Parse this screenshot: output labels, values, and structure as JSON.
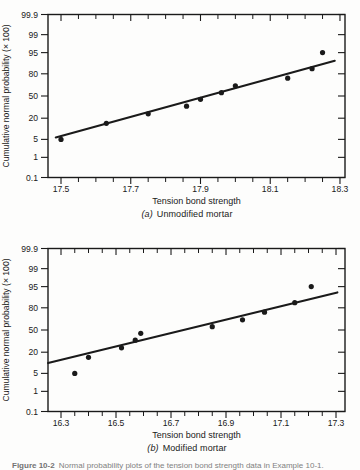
{
  "page": {
    "background": "#fdfdfc",
    "ink_color": "#1a1a1a"
  },
  "chart_data": [
    {
      "id": "a",
      "type": "scatter",
      "caption_label": "(a)",
      "caption_text": "Unmodified mortar",
      "xlabel": "Tension bond strength",
      "ylabel": "Cumulative normal probability (× 100)",
      "y_scale": "normal-probability",
      "y_tick_labels": [
        "99.9",
        "99",
        "95",
        "80",
        "50",
        "20",
        "5",
        "1",
        "0.1"
      ],
      "ylim_percent": [
        0.1,
        99.9
      ],
      "x_major_ticks": [
        17.5,
        17.7,
        17.9,
        18.1,
        18.3
      ],
      "x_minor_step": 0.05,
      "xlim": [
        17.4627,
        18.3144
      ],
      "grid": false,
      "legend": "none",
      "points_x": [
        17.5,
        17.63,
        17.75,
        17.86,
        17.9,
        17.96,
        18.0,
        18.15,
        18.22,
        18.25
      ],
      "points_percent": [
        5,
        15,
        25,
        35,
        45,
        55,
        65,
        75,
        85,
        95
      ],
      "fit_line": {
        "x1": 17.485,
        "p1": 5.8,
        "x2": 18.285,
        "p2": 90.9
      }
    },
    {
      "id": "b",
      "type": "scatter",
      "caption_label": "(b)",
      "caption_text": "Modified mortar",
      "xlabel": "Tension bond strength",
      "ylabel": "Cumulative normal probability (× 100)",
      "y_scale": "normal-probability",
      "y_tick_labels": [
        "99.9",
        "99",
        "95",
        "80",
        "50",
        "20",
        "5",
        "1",
        "0.1"
      ],
      "ylim_percent": [
        0.1,
        99.9
      ],
      "x_major_ticks": [
        16.3,
        16.5,
        16.7,
        16.9,
        17.1,
        17.3
      ],
      "x_minor_step": 0.05,
      "xlim": [
        16.2527,
        17.3327
      ],
      "grid": false,
      "legend": "none",
      "points_x": [
        16.35,
        16.4,
        16.52,
        16.57,
        16.59,
        16.85,
        16.96,
        17.04,
        17.15,
        17.21
      ],
      "points_percent": [
        5,
        15,
        25,
        35,
        45,
        55,
        65,
        75,
        85,
        95
      ],
      "fit_line": {
        "x1": 16.253,
        "p1": 10.5,
        "x2": 17.305,
        "p2": 92.3
      }
    }
  ],
  "cropped_caption": {
    "bold_part": "Figure 10-2",
    "text_part": "Normal probability plots of the tension bond strength data in Example 10-1."
  }
}
